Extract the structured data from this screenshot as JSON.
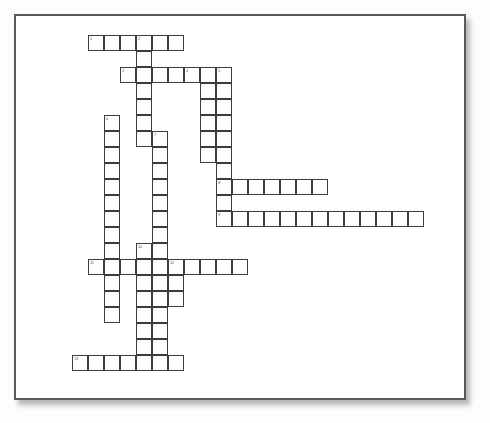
{
  "page": {
    "background_color": "#fdfdfd",
    "frame_border_color": "#5a5a5a",
    "cell_border_color": "#3c3c3c",
    "cell_fill_color": "#ffffff",
    "number_color": "#555555",
    "cell_size_px": 16
  },
  "crossword": {
    "type": "blank-crossword-grid",
    "cell_size_px": 16,
    "origin": {
      "x": 0,
      "y": 0
    },
    "entries": [
      {
        "number": "1",
        "direction": "across",
        "length": 6,
        "row": 1,
        "col": 5
      },
      {
        "number": "2",
        "direction": "down",
        "length": 8,
        "row": 1,
        "col": 8
      },
      {
        "number": "3",
        "direction": "across",
        "length": 7,
        "row": 3,
        "col": 7
      },
      {
        "number": "4",
        "direction": "down",
        "length": 6,
        "row": 3,
        "col": 11
      },
      {
        "number": "5",
        "direction": "down",
        "length": 11,
        "row": 3,
        "col": 13
      },
      {
        "number": "6",
        "direction": "down",
        "length": 9,
        "row": 7,
        "col": 6
      },
      {
        "number": "7",
        "direction": "down",
        "length": 14,
        "row": 8,
        "col": 9
      },
      {
        "number": "8",
        "direction": "across",
        "length": 7,
        "row": 10,
        "col": 13
      },
      {
        "number": "9",
        "direction": "across",
        "length": 13,
        "row": 12,
        "col": 13
      },
      {
        "number": "10",
        "direction": "down",
        "length": 9,
        "row": 14,
        "col": 8
      },
      {
        "number": "11",
        "direction": "across",
        "length": 10,
        "row": 15,
        "col": 5
      },
      {
        "number": "12",
        "direction": "down",
        "length": 4,
        "row": 15,
        "col": 10
      },
      {
        "number": "13",
        "direction": "across",
        "length": 7,
        "row": 21,
        "col": 4
      }
    ],
    "cells": [
      {
        "x": 72,
        "y": 19,
        "number": "1"
      },
      {
        "x": 88,
        "y": 19,
        "number": ""
      },
      {
        "x": 104,
        "y": 19,
        "number": ""
      },
      {
        "x": 120,
        "y": 19,
        "number": "2"
      },
      {
        "x": 136,
        "y": 19,
        "number": ""
      },
      {
        "x": 152,
        "y": 19,
        "number": ""
      },
      {
        "x": 120,
        "y": 35,
        "number": ""
      },
      {
        "x": 104,
        "y": 51,
        "number": "3"
      },
      {
        "x": 120,
        "y": 51,
        "number": ""
      },
      {
        "x": 136,
        "y": 51,
        "number": ""
      },
      {
        "x": 152,
        "y": 51,
        "number": ""
      },
      {
        "x": 168,
        "y": 51,
        "number": "4"
      },
      {
        "x": 184,
        "y": 51,
        "number": ""
      },
      {
        "x": 200,
        "y": 51,
        "number": "5"
      },
      {
        "x": 120,
        "y": 67,
        "number": ""
      },
      {
        "x": 184,
        "y": 67,
        "number": ""
      },
      {
        "x": 200,
        "y": 67,
        "number": ""
      },
      {
        "x": 120,
        "y": 83,
        "number": ""
      },
      {
        "x": 184,
        "y": 83,
        "number": ""
      },
      {
        "x": 200,
        "y": 83,
        "number": ""
      },
      {
        "x": 88,
        "y": 99,
        "number": "6"
      },
      {
        "x": 120,
        "y": 99,
        "number": ""
      },
      {
        "x": 184,
        "y": 99,
        "number": ""
      },
      {
        "x": 200,
        "y": 99,
        "number": ""
      },
      {
        "x": 88,
        "y": 115,
        "number": ""
      },
      {
        "x": 120,
        "y": 115,
        "number": ""
      },
      {
        "x": 136,
        "y": 115,
        "number": "7"
      },
      {
        "x": 184,
        "y": 115,
        "number": ""
      },
      {
        "x": 200,
        "y": 115,
        "number": ""
      },
      {
        "x": 88,
        "y": 131,
        "number": ""
      },
      {
        "x": 136,
        "y": 131,
        "number": ""
      },
      {
        "x": 184,
        "y": 131,
        "number": ""
      },
      {
        "x": 200,
        "y": 131,
        "number": ""
      },
      {
        "x": 88,
        "y": 147,
        "number": ""
      },
      {
        "x": 136,
        "y": 147,
        "number": ""
      },
      {
        "x": 200,
        "y": 147,
        "number": ""
      },
      {
        "x": 88,
        "y": 163,
        "number": ""
      },
      {
        "x": 136,
        "y": 163,
        "number": ""
      },
      {
        "x": 200,
        "y": 163,
        "number": "8"
      },
      {
        "x": 216,
        "y": 163,
        "number": ""
      },
      {
        "x": 232,
        "y": 163,
        "number": ""
      },
      {
        "x": 248,
        "y": 163,
        "number": ""
      },
      {
        "x": 264,
        "y": 163,
        "number": ""
      },
      {
        "x": 280,
        "y": 163,
        "number": ""
      },
      {
        "x": 296,
        "y": 163,
        "number": ""
      },
      {
        "x": 88,
        "y": 179,
        "number": ""
      },
      {
        "x": 136,
        "y": 179,
        "number": ""
      },
      {
        "x": 200,
        "y": 179,
        "number": ""
      },
      {
        "x": 88,
        "y": 195,
        "number": ""
      },
      {
        "x": 136,
        "y": 195,
        "number": ""
      },
      {
        "x": 200,
        "y": 195,
        "number": "9"
      },
      {
        "x": 216,
        "y": 195,
        "number": ""
      },
      {
        "x": 232,
        "y": 195,
        "number": ""
      },
      {
        "x": 248,
        "y": 195,
        "number": ""
      },
      {
        "x": 264,
        "y": 195,
        "number": ""
      },
      {
        "x": 280,
        "y": 195,
        "number": ""
      },
      {
        "x": 296,
        "y": 195,
        "number": ""
      },
      {
        "x": 312,
        "y": 195,
        "number": ""
      },
      {
        "x": 328,
        "y": 195,
        "number": ""
      },
      {
        "x": 344,
        "y": 195,
        "number": ""
      },
      {
        "x": 360,
        "y": 195,
        "number": ""
      },
      {
        "x": 376,
        "y": 195,
        "number": ""
      },
      {
        "x": 392,
        "y": 195,
        "number": ""
      },
      {
        "x": 88,
        "y": 211,
        "number": ""
      },
      {
        "x": 136,
        "y": 211,
        "number": ""
      },
      {
        "x": 88,
        "y": 227,
        "number": ""
      },
      {
        "x": 120,
        "y": 227,
        "number": "10"
      },
      {
        "x": 136,
        "y": 227,
        "number": ""
      },
      {
        "x": 72,
        "y": 243,
        "number": "11"
      },
      {
        "x": 88,
        "y": 243,
        "number": ""
      },
      {
        "x": 104,
        "y": 243,
        "number": ""
      },
      {
        "x": 120,
        "y": 243,
        "number": ""
      },
      {
        "x": 136,
        "y": 243,
        "number": ""
      },
      {
        "x": 152,
        "y": 243,
        "number": "12"
      },
      {
        "x": 168,
        "y": 243,
        "number": ""
      },
      {
        "x": 184,
        "y": 243,
        "number": ""
      },
      {
        "x": 200,
        "y": 243,
        "number": ""
      },
      {
        "x": 216,
        "y": 243,
        "number": ""
      },
      {
        "x": 88,
        "y": 259,
        "number": ""
      },
      {
        "x": 120,
        "y": 259,
        "number": ""
      },
      {
        "x": 136,
        "y": 259,
        "number": ""
      },
      {
        "x": 152,
        "y": 259,
        "number": ""
      },
      {
        "x": 88,
        "y": 275,
        "number": ""
      },
      {
        "x": 120,
        "y": 275,
        "number": ""
      },
      {
        "x": 136,
        "y": 275,
        "number": ""
      },
      {
        "x": 152,
        "y": 275,
        "number": ""
      },
      {
        "x": 88,
        "y": 291,
        "number": ""
      },
      {
        "x": 120,
        "y": 291,
        "number": ""
      },
      {
        "x": 136,
        "y": 291,
        "number": ""
      },
      {
        "x": 120,
        "y": 307,
        "number": ""
      },
      {
        "x": 136,
        "y": 307,
        "number": ""
      },
      {
        "x": 120,
        "y": 323,
        "number": ""
      },
      {
        "x": 136,
        "y": 323,
        "number": ""
      },
      {
        "x": 56,
        "y": 339,
        "number": "13"
      },
      {
        "x": 72,
        "y": 339,
        "number": ""
      },
      {
        "x": 88,
        "y": 339,
        "number": ""
      },
      {
        "x": 104,
        "y": 339,
        "number": ""
      },
      {
        "x": 120,
        "y": 339,
        "number": ""
      },
      {
        "x": 136,
        "y": 339,
        "number": ""
      },
      {
        "x": 152,
        "y": 339,
        "number": ""
      }
    ]
  }
}
